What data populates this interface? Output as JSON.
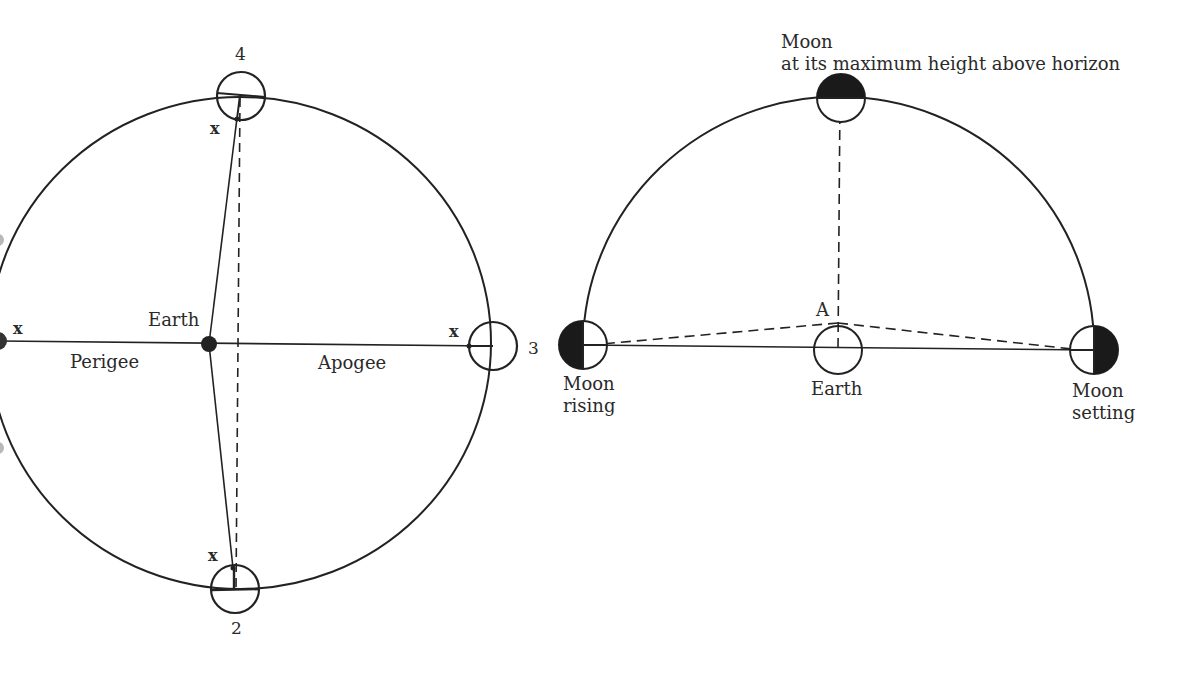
{
  "left_diagram": {
    "title": "Lunar orbit around Earth",
    "labels": {
      "earth": "Earth",
      "perigee": "Perigee",
      "apogee": "Apogee",
      "pos_4": "4",
      "pos_3": "3",
      "pos_2": "2",
      "x_top": "x",
      "x_bottom": "x",
      "x_left": "x",
      "x_right": "x"
    }
  },
  "right_diagram": {
    "title": "Moon rising, culminating and setting",
    "labels": {
      "moon_top_line1": "Moon",
      "moon_top_line2": "at its maximum height above horizon",
      "point_a": "A",
      "earth": "Earth",
      "rising_line1": "Moon",
      "rising_line2": "rising",
      "setting_line1": "Moon",
      "setting_line2": "setting"
    }
  },
  "colors": {
    "ink": "#222222",
    "background": "#ffffff"
  }
}
